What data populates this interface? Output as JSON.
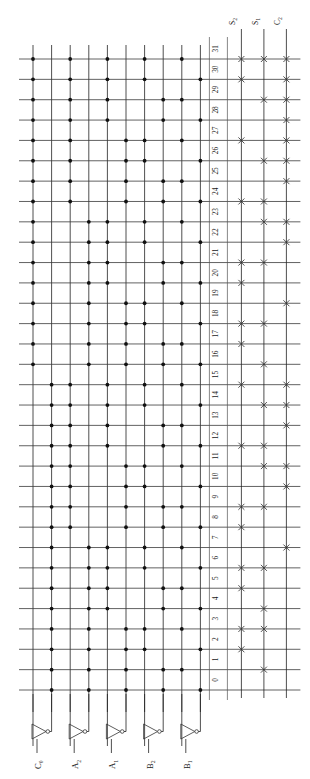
{
  "diagram": {
    "type": "rom-pla-array",
    "orientation": "rotated-90-ccw",
    "input_labels": [
      "C0",
      "A2",
      "A1",
      "B2",
      "B1"
    ],
    "input_labels_display": [
      {
        "base": "C",
        "sub": "0"
      },
      {
        "base": "A",
        "sub": "2"
      },
      {
        "base": "A",
        "sub": "1"
      },
      {
        "base": "B",
        "sub": "2"
      },
      {
        "base": "B",
        "sub": "1"
      }
    ],
    "output_labels": [
      "S2",
      "S1",
      "C2"
    ],
    "output_labels_display": [
      {
        "base": "S",
        "sub": "2"
      },
      {
        "base": "S",
        "sub": "1"
      },
      {
        "base": "C",
        "sub": "2"
      }
    ],
    "word_line_numbers": [
      "0",
      "1",
      "2",
      "3",
      "4",
      "5",
      "6",
      "7",
      "8",
      "9",
      "10",
      "11",
      "12",
      "13",
      "14",
      "15",
      "16",
      "17",
      "18",
      "19",
      "20",
      "21",
      "22",
      "23",
      "24",
      "25",
      "26",
      "27",
      "28",
      "29",
      "30",
      "31"
    ],
    "word_line_count": 32,
    "input_column_count": 10,
    "output_column_count": 3,
    "colors": {
      "line": "#222222",
      "dot": "#111111",
      "xmark": "#333333",
      "background": "#ffffff",
      "text": "#1a1a1a"
    },
    "decoder_dots": [
      [
        0,
        0,
        0,
        0,
        0
      ],
      [
        0,
        0,
        0,
        0,
        1
      ],
      [
        0,
        0,
        0,
        1,
        0
      ],
      [
        0,
        0,
        0,
        1,
        1
      ],
      [
        0,
        0,
        1,
        0,
        0
      ],
      [
        0,
        0,
        1,
        0,
        1
      ],
      [
        0,
        0,
        1,
        1,
        0
      ],
      [
        0,
        0,
        1,
        1,
        1
      ],
      [
        0,
        1,
        0,
        0,
        0
      ],
      [
        0,
        1,
        0,
        0,
        1
      ],
      [
        0,
        1,
        0,
        1,
        0
      ],
      [
        0,
        1,
        0,
        1,
        1
      ],
      [
        0,
        1,
        1,
        0,
        0
      ],
      [
        0,
        1,
        1,
        0,
        1
      ],
      [
        0,
        1,
        1,
        1,
        0
      ],
      [
        0,
        1,
        1,
        1,
        1
      ],
      [
        1,
        0,
        0,
        0,
        0
      ],
      [
        1,
        0,
        0,
        0,
        1
      ],
      [
        1,
        0,
        0,
        1,
        0
      ],
      [
        1,
        0,
        0,
        1,
        1
      ],
      [
        1,
        0,
        1,
        0,
        0
      ],
      [
        1,
        0,
        1,
        0,
        1
      ],
      [
        1,
        0,
        1,
        1,
        0
      ],
      [
        1,
        0,
        1,
        1,
        1
      ],
      [
        1,
        1,
        0,
        0,
        0
      ],
      [
        1,
        1,
        0,
        0,
        1
      ],
      [
        1,
        1,
        0,
        1,
        0
      ],
      [
        1,
        1,
        0,
        1,
        1
      ],
      [
        1,
        1,
        1,
        0,
        0
      ],
      [
        1,
        1,
        1,
        0,
        1
      ],
      [
        1,
        1,
        1,
        1,
        0
      ],
      [
        1,
        1,
        1,
        1,
        1
      ]
    ],
    "output_marks": [
      [
        0,
        0,
        0
      ],
      [
        0,
        1,
        0
      ],
      [
        1,
        0,
        0
      ],
      [
        1,
        1,
        0
      ],
      [
        0,
        1,
        0
      ],
      [
        1,
        0,
        0
      ],
      [
        1,
        1,
        0
      ],
      [
        0,
        0,
        1
      ],
      [
        1,
        0,
        0
      ],
      [
        1,
        1,
        0
      ],
      [
        0,
        0,
        1
      ],
      [
        0,
        1,
        1
      ],
      [
        1,
        1,
        0
      ],
      [
        0,
        0,
        1
      ],
      [
        0,
        1,
        1
      ],
      [
        1,
        0,
        1
      ],
      [
        0,
        1,
        0
      ],
      [
        1,
        0,
        0
      ],
      [
        1,
        1,
        0
      ],
      [
        0,
        0,
        1
      ],
      [
        1,
        0,
        0
      ],
      [
        1,
        1,
        0
      ],
      [
        0,
        0,
        1
      ],
      [
        0,
        1,
        1
      ],
      [
        1,
        1,
        0
      ],
      [
        0,
        0,
        1
      ],
      [
        0,
        1,
        1
      ],
      [
        1,
        0,
        1
      ],
      [
        0,
        0,
        1
      ],
      [
        0,
        1,
        1
      ],
      [
        1,
        0,
        1
      ],
      [
        1,
        1,
        1
      ]
    ]
  }
}
